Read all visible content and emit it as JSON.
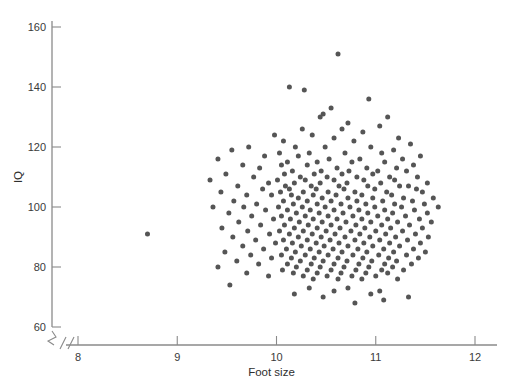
{
  "chart_data": {
    "type": "scatter",
    "title": "",
    "xlabel": "Foot size",
    "ylabel": "IQ",
    "xlim": [
      8,
      12
    ],
    "ylim": [
      60,
      160
    ],
    "xticks": [
      8,
      9,
      10,
      11,
      12
    ],
    "yticks": [
      60,
      80,
      100,
      120,
      140,
      160
    ],
    "grid": false,
    "legend": null,
    "axis_break": {
      "axis": "x",
      "symbol": "//",
      "note": "break between origin and x=8"
    },
    "marker": {
      "shape": "circle",
      "color": "#555555",
      "size": 5
    },
    "n_points": 268,
    "annotations": [],
    "correlation_note": "no apparent relationship between foot size and IQ",
    "points": [
      [
        10.62,
        151
      ],
      [
        10.13,
        140
      ],
      [
        10.28,
        139
      ],
      [
        10.93,
        136
      ],
      [
        11.12,
        130
      ],
      [
        10.55,
        133
      ],
      [
        10.47,
        131
      ],
      [
        10.44,
        130
      ],
      [
        10.72,
        128
      ],
      [
        11.04,
        127
      ],
      [
        10.26,
        126
      ],
      [
        10.66,
        126
      ],
      [
        10.87,
        125
      ],
      [
        9.98,
        124
      ],
      [
        10.36,
        124
      ],
      [
        10.58,
        123
      ],
      [
        11.23,
        123
      ],
      [
        10.07,
        122
      ],
      [
        10.78,
        122
      ],
      [
        11.35,
        121
      ],
      [
        9.72,
        120
      ],
      [
        10.19,
        120
      ],
      [
        10.49,
        120
      ],
      [
        10.95,
        120
      ],
      [
        11.18,
        119
      ],
      [
        9.55,
        119
      ],
      [
        10.03,
        118
      ],
      [
        10.33,
        118
      ],
      [
        10.69,
        118
      ],
      [
        11.06,
        118
      ],
      [
        11.45,
        117
      ],
      [
        9.88,
        117
      ],
      [
        10.22,
        117
      ],
      [
        10.53,
        116
      ],
      [
        10.84,
        116
      ],
      [
        11.27,
        116
      ],
      [
        9.41,
        116
      ],
      [
        10.11,
        115
      ],
      [
        10.41,
        115
      ],
      [
        10.76,
        115
      ],
      [
        11.09,
        115
      ],
      [
        11.38,
        114
      ],
      [
        9.66,
        114
      ],
      [
        10.05,
        114
      ],
      [
        10.31,
        114
      ],
      [
        10.61,
        113
      ],
      [
        10.91,
        113
      ],
      [
        11.21,
        113
      ],
      [
        9.83,
        113
      ],
      [
        10.16,
        112
      ],
      [
        10.45,
        112
      ],
      [
        10.73,
        112
      ],
      [
        11.02,
        112
      ],
      [
        11.31,
        112
      ],
      [
        9.49,
        111
      ],
      [
        10.08,
        111
      ],
      [
        10.38,
        111
      ],
      [
        10.66,
        111
      ],
      [
        10.97,
        111
      ],
      [
        11.42,
        110
      ],
      [
        9.77,
        110
      ],
      [
        10.24,
        110
      ],
      [
        10.51,
        110
      ],
      [
        10.81,
        110
      ],
      [
        11.14,
        110
      ],
      [
        9.33,
        109
      ],
      [
        10.01,
        109
      ],
      [
        10.29,
        109
      ],
      [
        10.58,
        109
      ],
      [
        10.88,
        109
      ],
      [
        11.19,
        109
      ],
      [
        11.52,
        108
      ],
      [
        9.92,
        108
      ],
      [
        10.18,
        108
      ],
      [
        10.44,
        108
      ],
      [
        10.71,
        108
      ],
      [
        11.05,
        108
      ],
      [
        11.33,
        107
      ],
      [
        9.61,
        107
      ],
      [
        10.09,
        107
      ],
      [
        10.35,
        107
      ],
      [
        10.63,
        107
      ],
      [
        10.92,
        107
      ],
      [
        11.24,
        107
      ],
      [
        9.86,
        106
      ],
      [
        10.13,
        106
      ],
      [
        10.4,
        106
      ],
      [
        10.68,
        106
      ],
      [
        10.99,
        106
      ],
      [
        11.41,
        106
      ],
      [
        9.44,
        105
      ],
      [
        10.04,
        105
      ],
      [
        10.27,
        105
      ],
      [
        10.52,
        105
      ],
      [
        10.79,
        105
      ],
      [
        11.11,
        105
      ],
      [
        11.47,
        105
      ],
      [
        9.7,
        104
      ],
      [
        10.15,
        104
      ],
      [
        10.37,
        104
      ],
      [
        10.6,
        104
      ],
      [
        10.86,
        104
      ],
      [
        11.16,
        104
      ],
      [
        9.95,
        104
      ],
      [
        10.22,
        103
      ],
      [
        10.46,
        103
      ],
      [
        10.72,
        103
      ],
      [
        10.97,
        103
      ],
      [
        11.28,
        103
      ],
      [
        11.58,
        103
      ],
      [
        9.57,
        102
      ],
      [
        10.07,
        102
      ],
      [
        10.31,
        102
      ],
      [
        10.55,
        102
      ],
      [
        10.81,
        102
      ],
      [
        11.07,
        102
      ],
      [
        11.37,
        102
      ],
      [
        9.8,
        101
      ],
      [
        10.17,
        101
      ],
      [
        10.41,
        101
      ],
      [
        10.65,
        101
      ],
      [
        10.9,
        101
      ],
      [
        11.19,
        101
      ],
      [
        11.49,
        101
      ],
      [
        9.36,
        100
      ],
      [
        10.02,
        100
      ],
      [
        10.26,
        100
      ],
      [
        10.49,
        100
      ],
      [
        10.74,
        100
      ],
      [
        10.99,
        100
      ],
      [
        11.26,
        100
      ],
      [
        11.63,
        100
      ],
      [
        9.67,
        100
      ],
      [
        10.11,
        99
      ],
      [
        10.34,
        99
      ],
      [
        10.58,
        99
      ],
      [
        10.83,
        99
      ],
      [
        11.09,
        99
      ],
      [
        11.39,
        99
      ],
      [
        9.89,
        99
      ],
      [
        10.2,
        98
      ],
      [
        10.43,
        98
      ],
      [
        10.67,
        98
      ],
      [
        10.92,
        98
      ],
      [
        11.17,
        98
      ],
      [
        11.52,
        98
      ],
      [
        9.52,
        98
      ],
      [
        10.05,
        97
      ],
      [
        10.29,
        97
      ],
      [
        10.52,
        97
      ],
      [
        10.77,
        97
      ],
      [
        11.02,
        97
      ],
      [
        11.3,
        97
      ],
      [
        9.75,
        97
      ],
      [
        10.14,
        96
      ],
      [
        10.37,
        96
      ],
      [
        10.61,
        96
      ],
      [
        10.86,
        96
      ],
      [
        11.12,
        96
      ],
      [
        11.44,
        96
      ],
      [
        9.97,
        96
      ],
      [
        10.23,
        95
      ],
      [
        10.46,
        95
      ],
      [
        10.7,
        95
      ],
      [
        10.95,
        95
      ],
      [
        11.22,
        95
      ],
      [
        11.56,
        95
      ],
      [
        9.62,
        95
      ],
      [
        10.08,
        94
      ],
      [
        10.32,
        94
      ],
      [
        10.55,
        94
      ],
      [
        10.8,
        94
      ],
      [
        11.06,
        94
      ],
      [
        11.34,
        94
      ],
      [
        9.84,
        94
      ],
      [
        10.18,
        93
      ],
      [
        10.41,
        93
      ],
      [
        10.64,
        93
      ],
      [
        10.89,
        93
      ],
      [
        11.15,
        93
      ],
      [
        11.47,
        93
      ],
      [
        9.45,
        93
      ],
      [
        10.03,
        92
      ],
      [
        10.27,
        92
      ],
      [
        10.5,
        92
      ],
      [
        10.75,
        92
      ],
      [
        11.0,
        92
      ],
      [
        11.27,
        92
      ],
      [
        9.71,
        92
      ],
      [
        10.13,
        91
      ],
      [
        10.36,
        91
      ],
      [
        10.59,
        91
      ],
      [
        10.84,
        91
      ],
      [
        11.1,
        91
      ],
      [
        11.4,
        91
      ],
      [
        8.7,
        91
      ],
      [
        9.93,
        91
      ],
      [
        10.22,
        90
      ],
      [
        10.45,
        90
      ],
      [
        10.69,
        90
      ],
      [
        10.94,
        90
      ],
      [
        11.2,
        90
      ],
      [
        11.53,
        90
      ],
      [
        9.56,
        90
      ],
      [
        10.07,
        89
      ],
      [
        10.31,
        89
      ],
      [
        10.54,
        89
      ],
      [
        10.79,
        89
      ],
      [
        11.04,
        89
      ],
      [
        11.32,
        89
      ],
      [
        9.79,
        89
      ],
      [
        10.16,
        88
      ],
      [
        10.4,
        88
      ],
      [
        10.63,
        88
      ],
      [
        10.88,
        88
      ],
      [
        11.14,
        88
      ],
      [
        11.45,
        88
      ],
      [
        9.99,
        88
      ],
      [
        10.25,
        87
      ],
      [
        10.48,
        87
      ],
      [
        10.72,
        87
      ],
      [
        10.97,
        87
      ],
      [
        11.24,
        87
      ],
      [
        9.66,
        87
      ],
      [
        10.1,
        86
      ],
      [
        10.34,
        86
      ],
      [
        10.57,
        86
      ],
      [
        10.82,
        86
      ],
      [
        11.08,
        86
      ],
      [
        11.38,
        86
      ],
      [
        9.87,
        86
      ],
      [
        10.19,
        85
      ],
      [
        10.43,
        85
      ],
      [
        10.66,
        85
      ],
      [
        10.91,
        85
      ],
      [
        11.18,
        85
      ],
      [
        11.5,
        85
      ],
      [
        9.48,
        85
      ],
      [
        10.05,
        84
      ],
      [
        10.29,
        84
      ],
      [
        10.52,
        84
      ],
      [
        10.77,
        84
      ],
      [
        11.03,
        84
      ],
      [
        11.31,
        84
      ],
      [
        9.74,
        84
      ],
      [
        10.15,
        83
      ],
      [
        10.38,
        83
      ],
      [
        10.62,
        83
      ],
      [
        10.87,
        83
      ],
      [
        11.13,
        83
      ],
      [
        11.43,
        83
      ],
      [
        9.95,
        83
      ],
      [
        10.24,
        82
      ],
      [
        10.47,
        82
      ],
      [
        10.71,
        82
      ],
      [
        10.96,
        82
      ],
      [
        11.21,
        82
      ],
      [
        9.6,
        82
      ],
      [
        10.11,
        81
      ],
      [
        10.35,
        81
      ],
      [
        10.58,
        81
      ],
      [
        10.83,
        81
      ],
      [
        11.09,
        81
      ],
      [
        11.36,
        81
      ],
      [
        9.82,
        81
      ],
      [
        10.2,
        80
      ],
      [
        10.44,
        80
      ],
      [
        10.68,
        80
      ],
      [
        10.93,
        80
      ],
      [
        11.17,
        80
      ],
      [
        9.41,
        80
      ],
      [
        10.06,
        79
      ],
      [
        10.31,
        79
      ],
      [
        10.55,
        79
      ],
      [
        10.8,
        79
      ],
      [
        11.06,
        79
      ],
      [
        11.28,
        79
      ],
      [
        9.7,
        78
      ],
      [
        10.17,
        78
      ],
      [
        10.41,
        78
      ],
      [
        10.65,
        78
      ],
      [
        10.9,
        78
      ],
      [
        11.12,
        78
      ],
      [
        9.92,
        77
      ],
      [
        10.27,
        77
      ],
      [
        10.51,
        77
      ],
      [
        10.76,
        77
      ],
      [
        11.0,
        77
      ],
      [
        10.37,
        76
      ],
      [
        10.62,
        76
      ],
      [
        10.86,
        76
      ],
      [
        11.22,
        76
      ],
      [
        9.53,
        74
      ],
      [
        10.33,
        73
      ],
      [
        10.72,
        73
      ],
      [
        10.58,
        72
      ],
      [
        11.04,
        72
      ],
      [
        10.18,
        71
      ],
      [
        10.95,
        71
      ],
      [
        11.33,
        70
      ],
      [
        10.47,
        70
      ],
      [
        11.08,
        69
      ],
      [
        10.79,
        68
      ]
    ]
  },
  "axes": {
    "x_tick_labels": [
      "8",
      "9",
      "10",
      "11",
      "12"
    ],
    "y_tick_labels": [
      "60",
      "80",
      "100",
      "120",
      "140",
      "160"
    ],
    "x_title": "Foot size",
    "y_title": "IQ"
  }
}
